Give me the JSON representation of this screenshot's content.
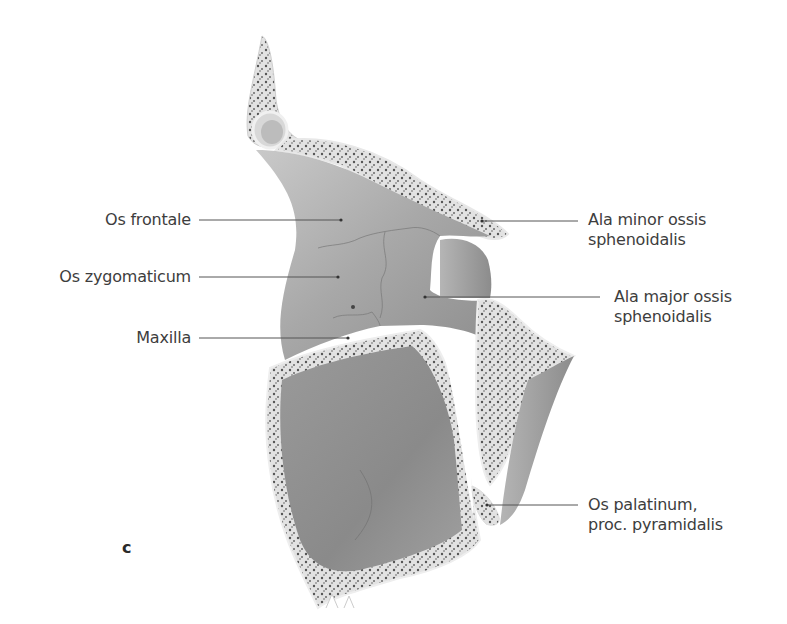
{
  "figure": {
    "panel_letter": "c",
    "colors": {
      "background": "#ffffff",
      "bone_surface": "#a9a9a9",
      "bone_dark": "#7d7d7d",
      "cortex": "#e6e6e6",
      "spongy": "#5a5a5a",
      "leader_line": "#555555",
      "label_text": "#3d3d3d"
    },
    "labels_left": [
      {
        "id": "os-frontale",
        "text": "Os frontale"
      },
      {
        "id": "os-zygomaticum",
        "text": "Os zygomaticum"
      },
      {
        "id": "maxilla",
        "text": "Maxilla"
      }
    ],
    "labels_right": [
      {
        "id": "ala-minor",
        "line1": "Ala minor ossis",
        "line2": "sphenoidalis"
      },
      {
        "id": "ala-major",
        "line1": "Ala major ossis",
        "line2": "sphenoidalis"
      },
      {
        "id": "os-palatinum",
        "line1": "Os palatinum,",
        "line2": "proc. pyramidalis"
      }
    ]
  }
}
